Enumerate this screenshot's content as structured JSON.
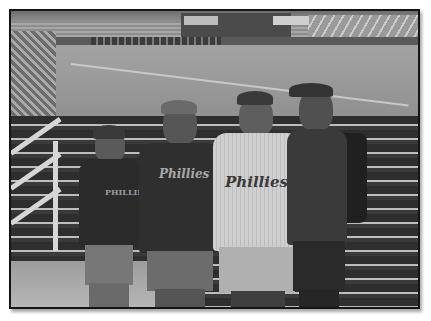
{
  "photo": {
    "description": "Grayscale photo of four men standing in the stands of a baseball stadium with the field behind them",
    "subjects": [
      {
        "position": "far-left",
        "shirt": "dark Adidas-style t-shirt",
        "shirt_text": "PHILLIES"
      },
      {
        "position": "center-left",
        "shirt": "dark t-shirt",
        "shirt_text": "Phillies"
      },
      {
        "position": "center-right",
        "shirt": "white pinstripe jersey",
        "shirt_text": "Phillies"
      },
      {
        "position": "far-right",
        "shirt": "dark t-shirt with backpack",
        "shirt_text": ""
      }
    ],
    "colors": {
      "frame_border": "#151515",
      "background": "#ffffff"
    }
  }
}
